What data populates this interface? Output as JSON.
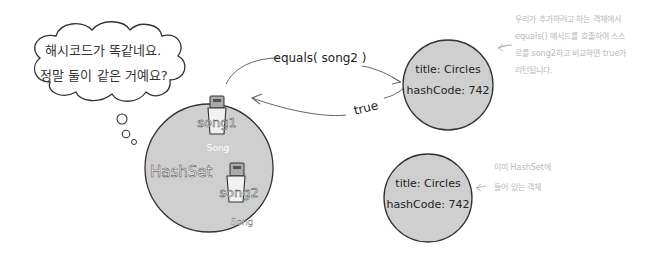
{
  "thought_bubble": {
    "line1": "해시코드가 똑같네요.",
    "line2": "정말 둘이 같은 거예요?"
  },
  "hashset": {
    "label": "HashSet",
    "items": [
      {
        "ref": "song1",
        "type": "Song"
      },
      {
        "ref": "song2",
        "type": "Song"
      }
    ]
  },
  "call": {
    "method": "equals( song2 )",
    "result": "true"
  },
  "objects": [
    {
      "title_line": "title: Circles",
      "hash_line": "hashCode: 742"
    },
    {
      "title_line": "title: Circles",
      "hash_line": "hashCode: 742"
    }
  ],
  "annotations": {
    "top": [
      "우리가 추가하려고 하는 객체에서",
      "equals() 메서드를 호출하여 스스",
      "로를 song2하고 비교하면 true가",
      "리턴됩니다."
    ],
    "bottom": [
      "이미 HashSet에",
      "들어 있는 객체"
    ]
  },
  "colors": {
    "circle_fill": "#cfcfcf",
    "stroke": "#333333",
    "annotation": "#b8b8b8"
  }
}
